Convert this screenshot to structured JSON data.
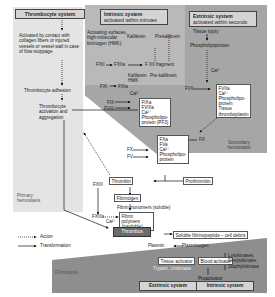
{
  "thrombocyte_system": {
    "title": "Thrombocyte system",
    "activation": "Activated by contact with collagen fibers or injured vessels or vessel wall in case of flow stoppage",
    "adhesion": "Thrombocyte adhesion",
    "aggregation": "Thrombocyte activation and aggregation",
    "label": "Primary hemostasis"
  },
  "intrinsic_system": {
    "title": "Intrinsic system",
    "subtitle": "activated within minutes",
    "activating": "Activating surfaces, high-molecular kininogen (HMK)",
    "kallikrein": "Kallikrein",
    "prekallikrein": "Prekallikrein",
    "fxii": "FXII",
    "fxiia": "FXIIa",
    "fxii_fragment": "F XII fragment",
    "kallikrein_hmk": "Kallikrein HMK",
    "pre_kallikrein": "Pre-kallikrein",
    "fxi": "FXI",
    "fxia": "FXIa",
    "ca": "Ca²⁺",
    "fix": "FIX",
    "fviii": "FVIII",
    "complex1": [
      "FIXa",
      "FVIIIa",
      "Ca²⁺",
      "Phospholipo-",
      "protein (PF3)"
    ],
    "fx": "FX",
    "fv": "FV",
    "complex2": [
      "FXa",
      "FVa",
      "Ca²⁺",
      "Phospholipo-",
      "protein"
    ]
  },
  "extrinsic_system": {
    "title": "Extrinsic system",
    "subtitle": "activated within seconds",
    "tissue_injury": "Tissue injury",
    "phospholipoprotein": "Phospholipoprotein",
    "ca": "Ca²⁺",
    "fvii": "FVII",
    "complex": [
      "FVIIa",
      "Ca²⁺",
      "Phospholipo-",
      "protein",
      "Tissue",
      "thromboplastin"
    ],
    "fx": "FX",
    "label": "Secondary hemostasis"
  },
  "coagulation": {
    "thrombin": "Thrombin",
    "prothrombin": "Prothrombin",
    "fibrinogen": "Fibrinogen",
    "fibrin_monomers": "Fibrin monomers (soluble)",
    "fxiii": "FXIII",
    "fxiiia": "FXIIIa",
    "ca": "Ca²⁺",
    "fibrin_polymers": "Fibrin polymers (insoluble)",
    "thrombus": "Thrombus"
  },
  "fibrinolysis": {
    "soluble": "Soluble fibrinopeptide – cell debris",
    "plasmin": "Plasmin",
    "plasminogen": "Plasminogen",
    "tissue_activator": "Tissue activator",
    "trypsin": "Trypsin, Urokinase",
    "blood_activator": "Blood activator",
    "proactivator": "Proactivator",
    "lysokinases": "Lysokinases, Streptokinase, Staphylokinase",
    "extrinsic": "Extrinsic system",
    "intrinsic": "Intrinsic system",
    "label": "Fibrinolysis"
  },
  "legend": {
    "action": "Action",
    "transformation": "Transformation"
  },
  "colors": {
    "intrinsic_bg": "#b9b9b9",
    "extrinsic_bg": "#a6a6a6",
    "thrombocyte_bg": "#e4e4e4",
    "fibrinolysis_bg": "#8e8e8e",
    "thrombus_bg": "#6b6b6b"
  }
}
